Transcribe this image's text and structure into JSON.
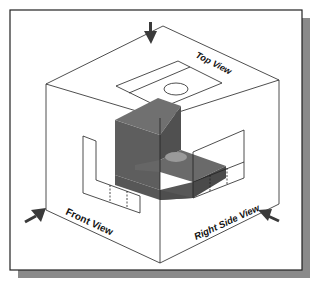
{
  "figure": {
    "labels": {
      "top_view": "Top View",
      "front_view": "Front View",
      "right_side_view": "Right Side View"
    },
    "colors": {
      "frame_border": "#222222",
      "frame_shadow": "#8a8a8a",
      "cube_lines": "#222222",
      "object_top": "#6e6e6e",
      "object_front": "#5a5a5a",
      "object_side": "#4a4a4a",
      "hole": "#9a9a9a",
      "arrow": "#3a3a3a"
    },
    "arrows": [
      "top-view-direction-arrow",
      "front-view-direction-arrow",
      "right-side-view-direction-arrow"
    ]
  }
}
